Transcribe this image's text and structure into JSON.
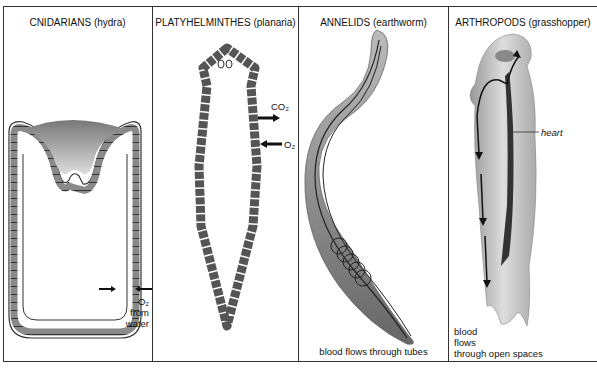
{
  "figure": {
    "panels": [
      {
        "title": "CNIDARIANS (hydra)",
        "labels": {
          "o2_line1": "O₂",
          "o2_line2": "from",
          "o2_line3": "water"
        }
      },
      {
        "title": "PLATYHELMINTHES (planaria)",
        "labels": {
          "co2": "CO₂",
          "o2": "O₂"
        }
      },
      {
        "title": "ANNELIDS (earthworm)",
        "labels": {
          "caption": "blood flows through tubes"
        }
      },
      {
        "title": "ARTHROPODS (grasshopper)",
        "labels": {
          "heart": "heart",
          "caption_line1": "blood",
          "caption_line2": "flows",
          "caption_line3": "through open spaces"
        }
      }
    ]
  }
}
